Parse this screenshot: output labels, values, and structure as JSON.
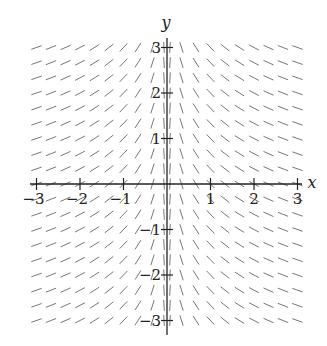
{
  "chart_data": {
    "type": "slope_field",
    "equation_inferred": "dy/dx = -1/x",
    "title": "",
    "xlabel": "x",
    "ylabel": "y",
    "xlim": [
      -3,
      3
    ],
    "ylim": [
      -3,
      3
    ],
    "x_ticks": [
      -3,
      -2,
      -1,
      1,
      2,
      3
    ],
    "y_ticks": [
      -3,
      -2,
      -1,
      1,
      2,
      3
    ],
    "x_tick_labels": [
      "−3",
      "−2",
      "−1",
      "1",
      "2",
      "3"
    ],
    "y_tick_labels": [
      "−3",
      "−2",
      "−1",
      "1",
      "2",
      "3"
    ],
    "grid": false,
    "legend": null,
    "grid_spacing": 0.333,
    "segment_color": "#777777",
    "axis_color": "#222222"
  }
}
